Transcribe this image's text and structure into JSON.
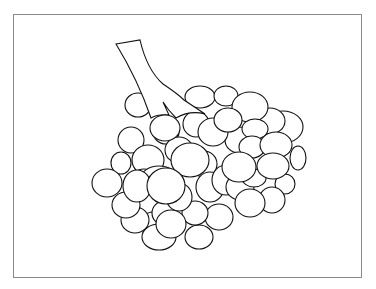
{
  "figure": {
    "stroke_color": "#111111",
    "fill_color": "#ffffff",
    "frame_color": "#8a8a8a"
  }
}
